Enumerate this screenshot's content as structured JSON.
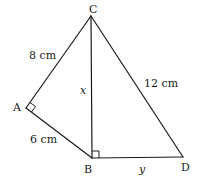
{
  "diagram": {
    "type": "geometry",
    "vertices": {
      "A": {
        "label": "A",
        "x": 26,
        "y": 108
      },
      "B": {
        "label": "B",
        "x": 92,
        "y": 158
      },
      "C": {
        "label": "C",
        "x": 91,
        "y": 16
      },
      "D": {
        "label": "D",
        "x": 183,
        "y": 157
      }
    },
    "segments": [
      {
        "from": "C",
        "to": "A",
        "label": "8 cm"
      },
      {
        "from": "A",
        "to": "B",
        "label": "6 cm"
      },
      {
        "from": "C",
        "to": "B",
        "label": "x"
      },
      {
        "from": "C",
        "to": "D",
        "label": "12 cm"
      },
      {
        "from": "B",
        "to": "D",
        "label": "y"
      }
    ],
    "right_angles": [
      "A",
      "B"
    ],
    "labels": {
      "ca": "8 cm",
      "ab": "6 cm",
      "cb": "x",
      "cd": "12 cm",
      "bd": "y"
    },
    "colors": {
      "stroke": "#1a1a1a",
      "background": "#ffffff"
    }
  }
}
